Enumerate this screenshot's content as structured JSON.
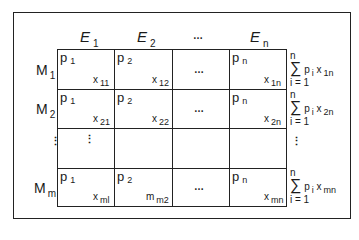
{
  "diagram": {
    "column_headers": [
      {
        "base": "E",
        "sub": "1"
      },
      {
        "base": "E",
        "sub": "2"
      },
      {
        "base": "…",
        "sub": ""
      },
      {
        "base": "E",
        "sub": "n"
      }
    ],
    "row_headers": [
      {
        "base": "M",
        "sub": "1"
      },
      {
        "base": "M",
        "sub": "2"
      },
      {
        "base": "⋮",
        "sub": ""
      },
      {
        "base": "M",
        "sub": "m"
      }
    ],
    "cells": [
      [
        {
          "p": "p",
          "p_sub": "1",
          "x": "x",
          "x_sub": "11"
        },
        {
          "p": "p",
          "p_sub": "2",
          "x": "x",
          "x_sub": "12"
        },
        {
          "ellipsis": "…"
        },
        {
          "p": "p",
          "p_sub": "n",
          "x": "x",
          "x_sub": "1n"
        }
      ],
      [
        {
          "p": "p",
          "p_sub": "1",
          "x": "x",
          "x_sub": "21"
        },
        {
          "p": "p",
          "p_sub": "2",
          "x": "x",
          "x_sub": "22"
        },
        {
          "ellipsis": "…"
        },
        {
          "p": "p",
          "p_sub": "n",
          "x": "x",
          "x_sub": "2n"
        }
      ],
      [
        {
          "vdots": "⋮"
        },
        {},
        {},
        {}
      ],
      [
        {
          "p": "p",
          "p_sub": "1",
          "x": "x",
          "x_sub": "ml"
        },
        {
          "p": "p",
          "p_sub": "2",
          "x": "m",
          "x_sub": "m2"
        },
        {
          "ellipsis": "…"
        },
        {
          "p": "p",
          "p_sub": "n",
          "x": "x",
          "x_sub": "mn"
        }
      ]
    ],
    "row_sums": [
      {
        "upper": "n",
        "sigma": "∑",
        "term": "p",
        "term_sub": "i",
        "x": "x",
        "x_sub": "1n",
        "lower": "i = 1"
      },
      {
        "upper": "n",
        "sigma": "∑",
        "term": "p",
        "term_sub": "i",
        "x": "x",
        "x_sub": "2n",
        "lower": "i = 1"
      },
      {
        "vdots": "⋮"
      },
      {
        "upper": "n",
        "sigma": "∑",
        "term": "p",
        "term_sub": "i",
        "x": "x",
        "x_sub": "mn",
        "lower": "i = 1"
      }
    ]
  }
}
